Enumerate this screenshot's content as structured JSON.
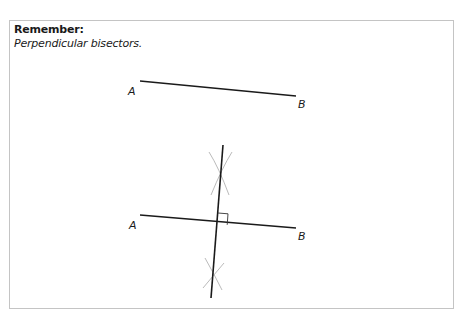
{
  "box": {
    "heading": "Remember:",
    "subheading": "Perpendicular bisectors."
  },
  "figures": {
    "original_segment": {
      "label_start": "A",
      "label_end": "B",
      "start": [
        140,
        81
      ],
      "end": [
        296,
        96
      ]
    },
    "bisected_segment": {
      "label_start": "A",
      "label_end": "B",
      "start": [
        140,
        215
      ],
      "end": [
        296,
        228
      ],
      "bisector_start": [
        223,
        145
      ],
      "bisector_end": [
        211,
        298
      ],
      "intersection": [
        217,
        224
      ],
      "right_angle_marker": true
    }
  },
  "colors": {
    "line": "#1a1a1a",
    "construction_arc": "#bbbbbb",
    "border": "#c4c4c4"
  }
}
